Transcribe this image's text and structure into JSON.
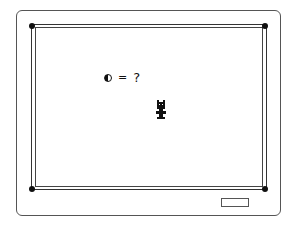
{
  "game": {
    "hud": {
      "symbol_icon": "half-moon-icon",
      "operator": "=",
      "value": "?"
    },
    "sprite": "robot-character",
    "colors": {
      "ink": "#111111",
      "background": "#ffffff"
    }
  }
}
